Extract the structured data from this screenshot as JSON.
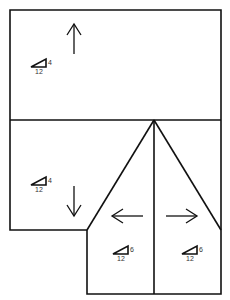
{
  "diagram": {
    "stroke_color": "#111111",
    "planes": [
      {
        "id": "upper",
        "direction": "up",
        "pitch": {
          "rise": "4",
          "run": "12"
        }
      },
      {
        "id": "lower-left",
        "direction": "down",
        "pitch": {
          "rise": "4",
          "run": "12"
        }
      },
      {
        "id": "gable-left",
        "direction": "left",
        "pitch": {
          "rise": "6",
          "run": "12"
        }
      },
      {
        "id": "gable-right",
        "direction": "right",
        "pitch": {
          "rise": "6",
          "run": "12"
        }
      }
    ]
  }
}
